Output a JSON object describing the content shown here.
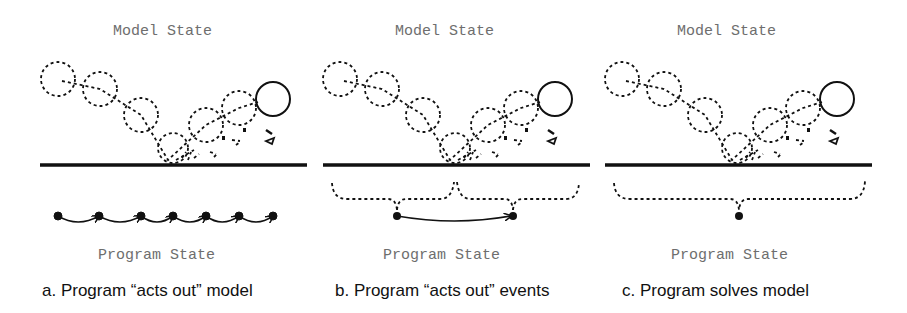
{
  "panels": [
    {
      "id": "a",
      "top_label": "Model State",
      "bottom_label": "Program State",
      "caption": "a. Program “acts out” model",
      "program_states": 7,
      "grouping": "none"
    },
    {
      "id": "b",
      "top_label": "Model State",
      "bottom_label": "Program State",
      "caption": "b. Program “acts out” events",
      "program_states": 2,
      "grouping": "two-braces"
    },
    {
      "id": "c",
      "top_label": "Model State",
      "bottom_label": "Program State",
      "caption": "c. Program solves model",
      "program_states": 1,
      "grouping": "one-brace"
    }
  ],
  "colors": {
    "ink": "#111111",
    "label_gray": "#6e6e6e",
    "background": "#ffffff"
  }
}
